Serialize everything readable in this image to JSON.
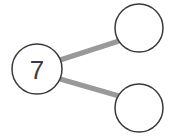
{
  "diagram": {
    "type": "number-bond",
    "background_color": "#ffffff",
    "whole": {
      "label": "whole-circle",
      "value": "7",
      "filled": true,
      "cx": 37,
      "cy": 69,
      "r": 25,
      "stroke_color": "#3a3a3a",
      "fill_color": "#ffffff",
      "stroke_width": 1.5,
      "text_color": "#3a3a3a",
      "font_size": 26
    },
    "parts": [
      {
        "label": "part-circle-top",
        "value": "",
        "filled": false,
        "cx": 139,
        "cy": 28,
        "r": 24,
        "stroke_color": "#3a3a3a",
        "fill_color": "#ffffff",
        "stroke_width": 1.5
      },
      {
        "label": "part-circle-bottom",
        "value": "",
        "filled": false,
        "cx": 139,
        "cy": 108,
        "r": 24,
        "stroke_color": "#3a3a3a",
        "fill_color": "#ffffff",
        "stroke_width": 1.5
      }
    ],
    "connectors": [
      {
        "label": "connector-to-top",
        "x1": 60,
        "y1": 60,
        "x2": 119,
        "y2": 41,
        "color": "#999999",
        "width": 5
      },
      {
        "label": "connector-to-bottom",
        "x1": 60,
        "y1": 79,
        "x2": 119,
        "y2": 96,
        "color": "#999999",
        "width": 5
      }
    ]
  }
}
